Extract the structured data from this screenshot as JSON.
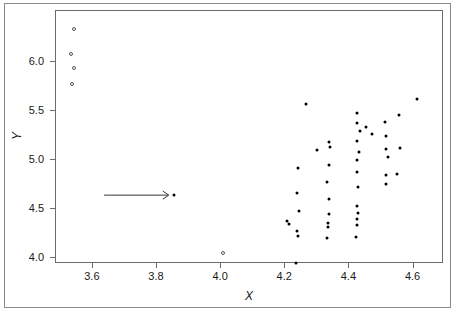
{
  "chart_data": {
    "type": "scatter",
    "title": "",
    "xlabel": "X",
    "ylabel": "Y",
    "xlim": [
      3.485,
      4.695
    ],
    "ylim": [
      3.935,
      6.525
    ],
    "xticks": [
      3.6,
      3.8,
      4.0,
      4.2,
      4.4,
      4.6
    ],
    "xticklabels": [
      "3.6",
      "3.8",
      "4.0",
      "4.2",
      "4.4",
      "4.6"
    ],
    "yticks": [
      4.0,
      4.5,
      5.0,
      5.5,
      6.0
    ],
    "yticklabels": [
      "4.0",
      "4.5",
      "5.0",
      "5.5",
      "6.0"
    ],
    "grid": false,
    "legend": null,
    "series": [
      {
        "name": "outliers",
        "marker": "open-circle",
        "points": [
          [
            3.541,
            6.34
          ],
          [
            3.532,
            6.08
          ],
          [
            3.541,
            5.94
          ],
          [
            3.535,
            5.78
          ],
          [
            4.006,
            4.05
          ]
        ]
      },
      {
        "name": "observations",
        "marker": "filled-circle",
        "points": [
          [
            3.852,
            4.64
          ],
          [
            4.232,
            3.95
          ],
          [
            4.239,
            4.22
          ],
          [
            4.236,
            4.27
          ],
          [
            4.205,
            4.38
          ],
          [
            4.212,
            4.34
          ],
          [
            4.243,
            4.48
          ],
          [
            4.331,
            4.2
          ],
          [
            4.334,
            4.31
          ],
          [
            4.333,
            4.35
          ],
          [
            4.336,
            4.45
          ],
          [
            4.422,
            4.21
          ],
          [
            4.425,
            4.33
          ],
          [
            4.424,
            4.4
          ],
          [
            4.427,
            4.46
          ],
          [
            4.424,
            4.53
          ],
          [
            4.337,
            4.6
          ],
          [
            4.238,
            4.66
          ],
          [
            4.428,
            4.72
          ],
          [
            4.33,
            4.77
          ],
          [
            4.515,
            4.75
          ],
          [
            4.513,
            4.85
          ],
          [
            4.549,
            4.86
          ],
          [
            4.425,
            4.88
          ],
          [
            4.239,
            4.92
          ],
          [
            4.335,
            4.95
          ],
          [
            4.423,
            5.0
          ],
          [
            4.519,
            5.03
          ],
          [
            4.43,
            5.08
          ],
          [
            4.34,
            5.13
          ],
          [
            4.299,
            5.1
          ],
          [
            4.515,
            5.11
          ],
          [
            4.557,
            5.12
          ],
          [
            4.424,
            5.19
          ],
          [
            4.335,
            5.18
          ],
          [
            4.514,
            5.25
          ],
          [
            4.47,
            5.27
          ],
          [
            4.433,
            5.3
          ],
          [
            4.452,
            5.34
          ],
          [
            4.425,
            5.38
          ],
          [
            4.51,
            5.39
          ],
          [
            4.556,
            5.46
          ],
          [
            4.423,
            5.48
          ],
          [
            4.264,
            5.57
          ],
          [
            4.611,
            5.62
          ]
        ]
      }
    ],
    "annotations": [
      {
        "type": "arrow",
        "name": "pointer-arrow",
        "x_start": 3.635,
        "x_end": 3.84,
        "y": 4.64,
        "direction": "right",
        "label": ""
      }
    ]
  }
}
